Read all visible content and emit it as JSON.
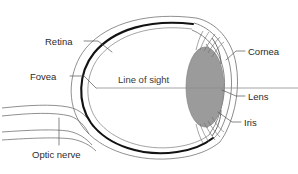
{
  "diagram": {
    "background_color": "#ffffff",
    "lens_fill_color": "#9b9b9b",
    "retina_band_color": "#121212",
    "outline_color": "#6b6b6b",
    "leader_color": "#555555",
    "sight_line_color": "#8e8e8e",
    "labels": {
      "retina": "Retina",
      "fovea": "Fovea",
      "optic_nerve": "Optic nerve",
      "line_of_sight": "Line of sight",
      "cornea": "Cornea",
      "lens": "Lens",
      "iris": "Iris"
    }
  }
}
